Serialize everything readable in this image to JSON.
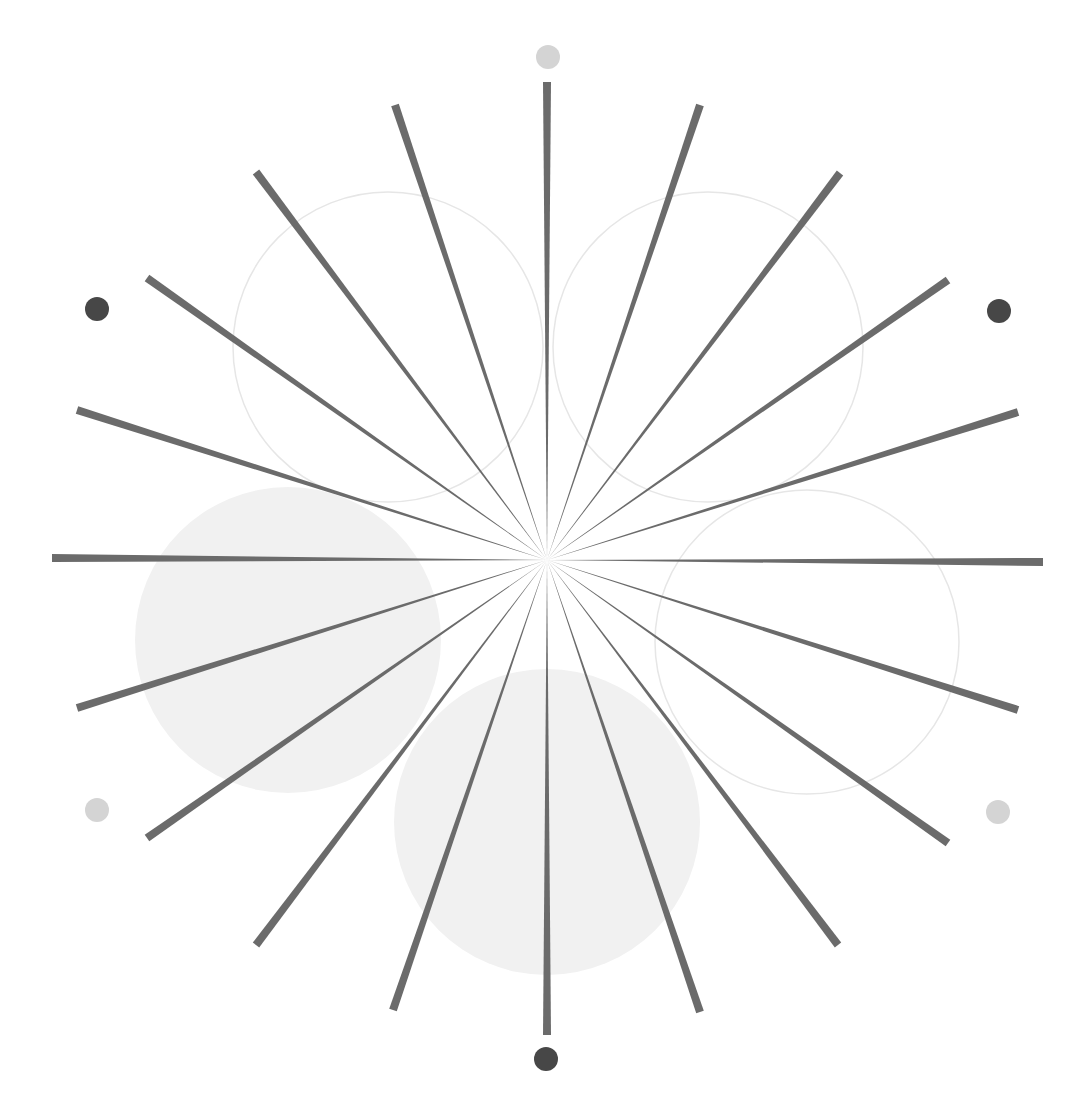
{
  "center": [
    547,
    560
  ],
  "colors": {
    "spoke": "#6b6b6b",
    "dot_dark": "#474747",
    "dot_light": "#d4d4d4",
    "circle_fill": "#f1f1f1",
    "circle_stroke": "#e6e6e6"
  },
  "spokes": [
    [
      547,
      82
    ],
    [
      700,
      105
    ],
    [
      840,
      173
    ],
    [
      948,
      280
    ],
    [
      1018,
      412
    ],
    [
      1043,
      562
    ],
    [
      1018,
      710
    ],
    [
      948,
      843
    ],
    [
      838,
      945
    ],
    [
      700,
      1012
    ],
    [
      547,
      1035
    ],
    [
      393,
      1010
    ],
    [
      256,
      945
    ],
    [
      147,
      838
    ],
    [
      77,
      708
    ],
    [
      52,
      558
    ],
    [
      77,
      410
    ],
    [
      147,
      278
    ],
    [
      256,
      172
    ],
    [
      395,
      105
    ]
  ],
  "circles": [
    {
      "cx": 388,
      "cy": 347,
      "r": 155,
      "filled": false
    },
    {
      "cx": 708,
      "cy": 347,
      "r": 155,
      "filled": false
    },
    {
      "cx": 807,
      "cy": 642,
      "r": 152,
      "filled": false
    },
    {
      "cx": 288,
      "cy": 640,
      "r": 153,
      "filled": true
    },
    {
      "cx": 547,
      "cy": 822,
      "r": 153,
      "filled": true
    }
  ],
  "dots": [
    {
      "cx": 548,
      "cy": 57,
      "tone": "light"
    },
    {
      "cx": 97,
      "cy": 309,
      "tone": "dark"
    },
    {
      "cx": 999,
      "cy": 311,
      "tone": "dark"
    },
    {
      "cx": 97,
      "cy": 810,
      "tone": "light"
    },
    {
      "cx": 998,
      "cy": 812,
      "tone": "light"
    },
    {
      "cx": 546,
      "cy": 1059,
      "tone": "dark"
    }
  ]
}
